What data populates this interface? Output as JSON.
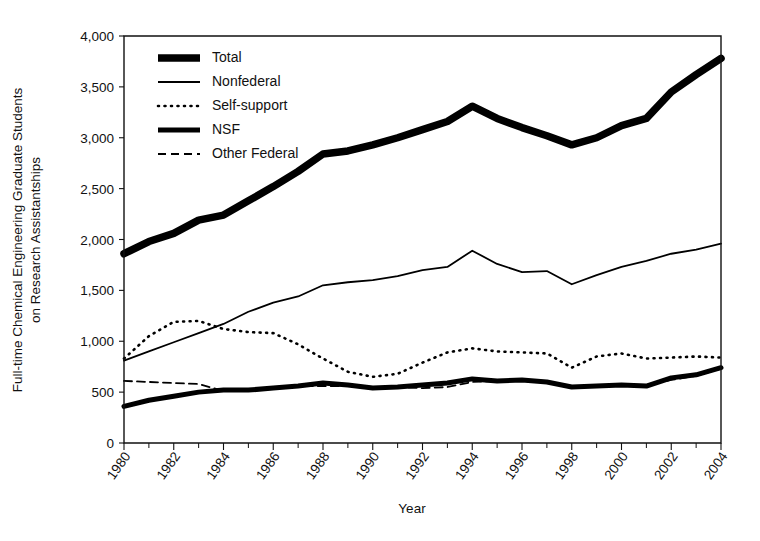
{
  "chart_data": {
    "type": "line",
    "title": "",
    "xlabel": "Year",
    "ylabel": "Full-time Chemical Engineering Graduate Students on Research Assistantships",
    "ylabel_lines": [
      "Full-time Chemical Engineering Graduate Students",
      "on Research Assistantships"
    ],
    "xlim": [
      1980,
      2004
    ],
    "ylim": [
      0,
      4000
    ],
    "y_ticks": [
      0,
      500,
      1000,
      1500,
      2000,
      2500,
      3000,
      3500,
      4000
    ],
    "y_tick_labels": [
      "0",
      "500",
      "1,000",
      "1,500",
      "2,000",
      "2,500",
      "3,000",
      "3,500",
      "4,000"
    ],
    "x_ticks_major": [
      1980,
      1982,
      1984,
      1986,
      1988,
      1990,
      1992,
      1994,
      1996,
      1998,
      2000,
      2002,
      2004
    ],
    "x_tick_labels": [
      "1980",
      "1982",
      "1984",
      "1986",
      "1988",
      "1990",
      "1992",
      "1994",
      "1996",
      "1998",
      "2000",
      "2002",
      "2004"
    ],
    "x_ticks_minor": [
      1981,
      1983,
      1985,
      1987,
      1989,
      1991,
      1993,
      1995,
      1997,
      1999,
      2001,
      2003
    ],
    "grid": false,
    "legend_position": "top-left-inside",
    "x": [
      1980,
      1981,
      1982,
      1983,
      1984,
      1985,
      1986,
      1987,
      1988,
      1989,
      1990,
      1991,
      1992,
      1993,
      1994,
      1995,
      1996,
      1997,
      1998,
      1999,
      2000,
      2001,
      2002,
      2003,
      2004
    ],
    "series": [
      {
        "name": "Total",
        "style": "solid",
        "width": 7.5,
        "dash": "",
        "color": "#000000",
        "values": [
          1860,
          1980,
          2060,
          2190,
          2240,
          2380,
          2520,
          2670,
          2840,
          2870,
          2930,
          3000,
          3080,
          3160,
          3310,
          3190,
          3100,
          3020,
          2930,
          3000,
          3120,
          3190,
          3450,
          3620,
          3780
        ]
      },
      {
        "name": "Nonfederal",
        "style": "solid",
        "width": 1.8,
        "dash": "",
        "color": "#000000",
        "values": [
          810,
          900,
          990,
          1080,
          1170,
          1290,
          1380,
          1440,
          1550,
          1580,
          1600,
          1640,
          1700,
          1730,
          1890,
          1760,
          1680,
          1690,
          1560,
          1650,
          1730,
          1790,
          1860,
          1900,
          1960
        ]
      },
      {
        "name": "Self-support",
        "style": "dotted",
        "width": 2.6,
        "dash": "1 5.5",
        "color": "#000000",
        "values": [
          830,
          1050,
          1190,
          1200,
          1120,
          1090,
          1080,
          970,
          830,
          700,
          650,
          680,
          790,
          890,
          930,
          900,
          890,
          880,
          740,
          850,
          880,
          830,
          840,
          850,
          840
        ]
      },
      {
        "name": "NSF",
        "style": "solid",
        "width": 5.0,
        "dash": "",
        "color": "#000000",
        "values": [
          360,
          420,
          460,
          500,
          520,
          520,
          540,
          560,
          590,
          570,
          540,
          550,
          570,
          590,
          630,
          610,
          620,
          600,
          550,
          560,
          570,
          560,
          640,
          670,
          740
        ]
      },
      {
        "name": "Other Federal",
        "style": "dashed",
        "width": 1.8,
        "dash": "8 5",
        "color": "#000000",
        "values": [
          610,
          600,
          590,
          580,
          510,
          520,
          540,
          560,
          560,
          560,
          550,
          550,
          540,
          550,
          600,
          610,
          610,
          600,
          550,
          560,
          570,
          570,
          620,
          660,
          730
        ]
      }
    ],
    "legend": [
      {
        "label": "Total",
        "swatch": "thick-solid"
      },
      {
        "label": "Nonfederal",
        "swatch": "thin-solid"
      },
      {
        "label": "Self-support",
        "swatch": "dotted"
      },
      {
        "label": "NSF",
        "swatch": "medium-solid"
      },
      {
        "label": "Other Federal",
        "swatch": "dashed"
      }
    ]
  }
}
